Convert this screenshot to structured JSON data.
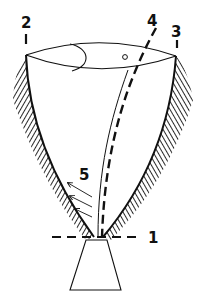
{
  "diagram": {
    "type": "technical-schematic",
    "colors": {
      "stroke": "#111111",
      "background": "#ffffff"
    },
    "labels": [
      {
        "id": "1",
        "text": "1",
        "refers_to": "horizontal dashed base line"
      },
      {
        "id": "2",
        "text": "2",
        "refers_to": "left top edge marker"
      },
      {
        "id": "3",
        "text": "3",
        "refers_to": "right top edge marker"
      },
      {
        "id": "4",
        "text": "4",
        "refers_to": "inclined dashed axis line"
      },
      {
        "id": "5",
        "text": "5",
        "refers_to": "flow arrows"
      }
    ],
    "arrows_count": 3
  }
}
